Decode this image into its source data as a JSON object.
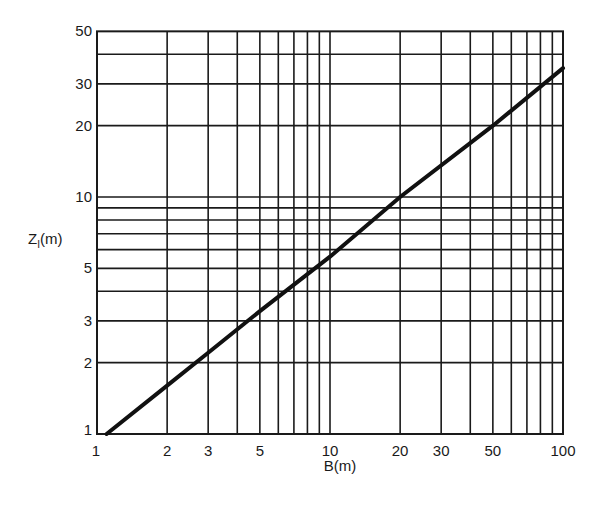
{
  "chart_data": {
    "type": "line",
    "title": "",
    "xlabel": "B(m)",
    "ylabel": "Z_I(m)",
    "ylabel_main": "Z",
    "ylabel_sub": "I",
    "ylabel_tail": "(m)",
    "xscale": "log",
    "yscale": "log",
    "xlim": [
      1,
      100
    ],
    "ylim": [
      1,
      50
    ],
    "grid": true,
    "x_ticks": [
      1,
      2,
      3,
      5,
      10,
      20,
      30,
      50,
      100
    ],
    "x_tick_labels": [
      "1",
      "2",
      "3",
      "5",
      "10",
      "20",
      "30",
      "50",
      "100"
    ],
    "y_ticks": [
      1,
      2,
      3,
      5,
      10,
      20,
      30,
      50
    ],
    "y_tick_labels": [
      "1",
      "2",
      "3",
      "5",
      "10",
      "20",
      "30",
      "50"
    ],
    "x_gridlines": [
      2,
      3,
      4,
      5,
      6,
      7,
      8,
      9,
      10,
      20,
      30,
      40,
      50,
      60,
      70,
      80,
      90
    ],
    "y_gridlines": [
      2,
      3,
      4,
      5,
      6,
      7,
      8,
      9,
      10,
      20,
      30,
      40
    ],
    "series": [
      {
        "name": "Z_I vs B",
        "x": [
          1.1,
          2,
          3,
          5,
          10,
          20,
          50,
          100
        ],
        "y": [
          1.0,
          1.6,
          2.2,
          3.3,
          5.6,
          10,
          20,
          35
        ]
      }
    ]
  },
  "labels": {
    "xlabel": "B(m)",
    "ylabel_main": "Z",
    "ylabel_sub": "I",
    "ylabel_tail": "(m)"
  }
}
